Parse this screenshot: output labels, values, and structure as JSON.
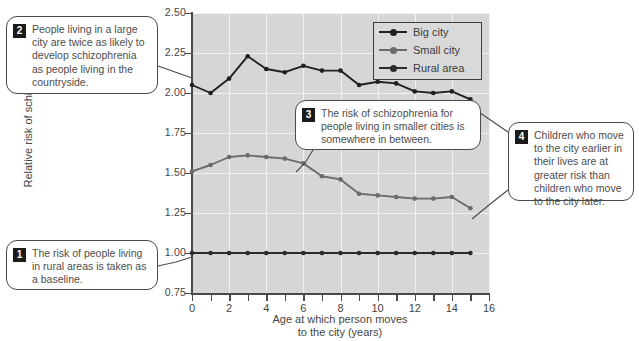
{
  "chart_data": {
    "type": "line",
    "title": "",
    "xlabel": "Age at which person moves to the city (years)",
    "ylabel": "Relative risk of schizophrenia",
    "xlim": [
      0,
      16
    ],
    "ylim": [
      0.75,
      2.5
    ],
    "xticks": [
      0,
      1,
      2,
      3,
      4,
      5,
      6,
      7,
      8,
      9,
      10,
      11,
      12,
      13,
      14,
      15,
      16
    ],
    "xticklabels": [
      "0",
      "",
      "2",
      "",
      "4",
      "",
      "6",
      "",
      "8",
      "",
      "10",
      "",
      "12",
      "",
      "14",
      "",
      "16"
    ],
    "yticks": [
      0.75,
      1.0,
      1.25,
      1.5,
      1.75,
      2.0,
      2.25,
      2.5
    ],
    "yticklabels": [
      "0.75",
      "1.00",
      "1.25",
      "1.50",
      "1.75",
      "2.00",
      "2.25",
      "2.50"
    ],
    "grid": true,
    "legend_position": "top-right",
    "x": [
      0,
      1,
      2,
      3,
      4,
      5,
      6,
      7,
      8,
      9,
      10,
      11,
      12,
      13,
      14,
      15
    ],
    "series": [
      {
        "name": "Big city",
        "color": "#231f20",
        "values": [
          2.05,
          2.0,
          2.09,
          2.23,
          2.15,
          2.13,
          2.17,
          2.14,
          2.14,
          2.05,
          2.07,
          2.06,
          2.01,
          2.0,
          2.01,
          1.96
        ]
      },
      {
        "name": "Small city",
        "color": "#6b6b6b",
        "values": [
          1.51,
          1.55,
          1.6,
          1.61,
          1.6,
          1.59,
          1.56,
          1.48,
          1.46,
          1.37,
          1.36,
          1.35,
          1.34,
          1.34,
          1.35,
          1.28
        ]
      },
      {
        "name": "Rural area",
        "color": "#2b2b2b",
        "values": [
          1.0,
          1.0,
          1.0,
          1.0,
          1.0,
          1.0,
          1.0,
          1.0,
          1.0,
          1.0,
          1.0,
          1.0,
          1.0,
          1.0,
          1.0,
          1.0
        ]
      }
    ]
  },
  "legend": {
    "items": [
      {
        "label": "Big city"
      },
      {
        "label": "Small city"
      },
      {
        "label": "Rural area"
      }
    ]
  },
  "axes": {
    "y_title": "Relative risk of schizophrenia",
    "x_title_line1": "Age at which person moves",
    "x_title_line2": "to the city (years)"
  },
  "callouts": [
    {
      "number": "1",
      "text": "The risk of people living in rural areas is taken as a baseline."
    },
    {
      "number": "2",
      "text": "People living in a large city are twice as likely to develop schizophrenia as people living in the countryside."
    },
    {
      "number": "3",
      "text": "The risk of schizophrenia for people living in smaller cities is somewhere in between."
    },
    {
      "number": "4",
      "text": "Children who move to the city earlier in their lives are at greater risk than children who move to the city later."
    }
  ],
  "colors": {
    "plot_background": "#d6d6d6",
    "grid": "#f2f2f2",
    "axis": "#4a4a4a",
    "big_city": "#231f20",
    "small_city": "#6b6b6b",
    "rural_area": "#2b2b2b",
    "callout_border": "#4a4a4a",
    "callout_text": "#4d4d4d"
  }
}
